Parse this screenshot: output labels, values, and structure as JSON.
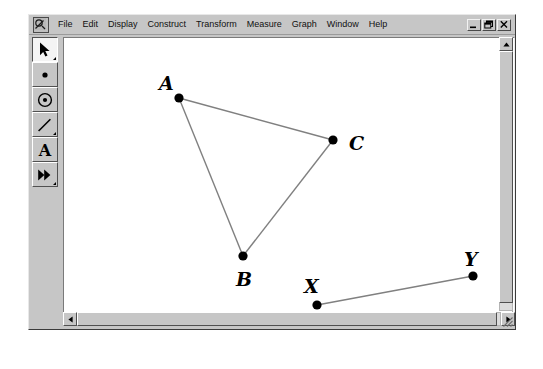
{
  "window": {
    "app_icon": "sketchpad-app-icon",
    "controls": {
      "minimize_label": "Minimize",
      "restore_label": "Restore",
      "close_label": "Close"
    }
  },
  "menu": {
    "items": [
      {
        "label": "File"
      },
      {
        "label": "Edit"
      },
      {
        "label": "Display"
      },
      {
        "label": "Construct"
      },
      {
        "label": "Transform"
      },
      {
        "label": "Measure"
      },
      {
        "label": "Graph"
      },
      {
        "label": "Window"
      },
      {
        "label": "Help"
      }
    ]
  },
  "toolbar": {
    "tools": [
      {
        "name": "selection-arrow-tool",
        "icon": "arrow-icon",
        "selected": true,
        "has_submenu": true
      },
      {
        "name": "point-tool",
        "icon": "point-icon",
        "selected": false,
        "has_submenu": false
      },
      {
        "name": "compass-circle-tool",
        "icon": "circle-icon",
        "selected": false,
        "has_submenu": false
      },
      {
        "name": "straightedge-tool",
        "icon": "segment-icon",
        "selected": false,
        "has_submenu": true
      },
      {
        "name": "text-tool",
        "icon": "letter-a-icon",
        "selected": false,
        "has_submenu": false
      },
      {
        "name": "custom-transform-tool",
        "icon": "double-arrow-icon",
        "selected": false,
        "has_submenu": true
      }
    ]
  },
  "scrollbars": {
    "vertical": {
      "up_label": "Scroll up",
      "down_label": "Scroll down"
    },
    "horizontal": {
      "left_label": "Scroll left",
      "right_label": "Scroll right"
    }
  },
  "sketch": {
    "stroke_color": "#808080",
    "point_color": "#000000",
    "canvas_color": "#ffffff",
    "points": [
      {
        "id": "A",
        "label": "A",
        "x": 115,
        "y": 60,
        "label_x": 95,
        "label_y": 52
      },
      {
        "id": "B",
        "label": "B",
        "x": 179,
        "y": 218,
        "label_x": 172,
        "label_y": 248
      },
      {
        "id": "C",
        "label": "C",
        "x": 269,
        "y": 102,
        "label_x": 285,
        "label_y": 112
      },
      {
        "id": "X",
        "label": "X",
        "x": 253,
        "y": 267,
        "label_x": 240,
        "label_y": 255
      },
      {
        "id": "Y",
        "label": "Y",
        "x": 409,
        "y": 238,
        "label_x": 400,
        "label_y": 228
      }
    ],
    "segments": [
      {
        "id": "AB",
        "from": "A",
        "to": "B"
      },
      {
        "id": "AC",
        "from": "A",
        "to": "C"
      },
      {
        "id": "BC",
        "from": "B",
        "to": "C"
      },
      {
        "id": "XY",
        "from": "X",
        "to": "Y"
      }
    ]
  }
}
